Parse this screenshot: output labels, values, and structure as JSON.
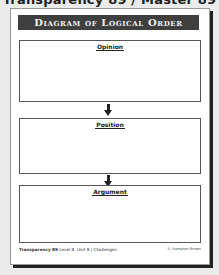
{
  "header": {
    "text": "Transparency 89 / Master 89",
    "note": "partially cut off at image top edge; reconstructed, not directly legible"
  },
  "document": {
    "title": "Diagram of Logical Order",
    "sections": [
      {
        "label": "Opinion"
      },
      {
        "label": "Position"
      },
      {
        "label": "Argument"
      }
    ],
    "arrows": [
      "down-arrow",
      "down-arrow"
    ],
    "footer": {
      "transparency_label": "Transparency",
      "transparency_number": "89",
      "unit_info": "Level 8, Unit 8 | Challenges",
      "credit": "© Hampton-Brown",
      "credit_note": "illegible in source; placeholder guess, not read from image",
      "number_note": "transparency number and unit_info are blurry; best-guess readings"
    }
  },
  "colors": {
    "title_bar": "#3f3f3f",
    "title_text": "#f2f2f2",
    "page_bg": "#ffffff",
    "outer_bg": "#ebebeb",
    "shadow": "#222222"
  }
}
